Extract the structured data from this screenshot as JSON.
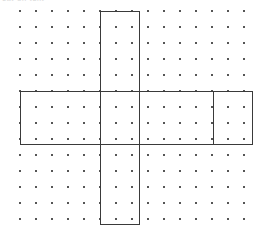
{
  "page": {
    "width": 269,
    "height": 241,
    "background_color": "#ffffff",
    "top_text_remnant": "cut-off text"
  },
  "dot_grid": {
    "name": "dot-grid",
    "dot_color": "#555555",
    "dot_size_px": 2,
    "spacing_px": 16,
    "origin_x": 20,
    "origin_y": 11,
    "columns": 15,
    "rows": 14
  },
  "figure": {
    "name": "cube-net-plus-shape",
    "line_color": "#3a3a3a",
    "line_width_px": 1,
    "vertical_bar": {
      "label": "vertical-bar",
      "left": 100,
      "right": 139,
      "top": 11,
      "bottom": 224,
      "width_units": 2,
      "height_units": 13
    },
    "horizontal_bar": {
      "label": "horizontal-bar",
      "left": 20,
      "right": 252,
      "top": 91,
      "bottom": 144,
      "width_units": 14,
      "height_units": 3
    },
    "internal_divider": {
      "label": "internal-divider",
      "x": 213,
      "top": 91,
      "bottom": 144
    }
  },
  "chart_data": {
    "type": "scatter",
    "title": "",
    "subtitle": "",
    "xlabel": "",
    "ylabel": "",
    "grid": true,
    "legend": "none",
    "xlim": [
      20,
      253
    ],
    "ylim": [
      11,
      219
    ],
    "x_ticks": [
      20,
      36,
      52,
      68,
      84,
      100,
      116,
      132,
      148,
      164,
      180,
      196,
      212,
      228,
      244
    ],
    "y_ticks": [
      11,
      27,
      43,
      59,
      75,
      91,
      107,
      123,
      139,
      155,
      171,
      187,
      203,
      219
    ],
    "annotations": [
      {
        "name": "vertical-bar-rectangle",
        "shape": "rectangle",
        "x0": 100,
        "y0": 11,
        "x1": 139,
        "y1": 224
      },
      {
        "name": "horizontal-bar-rectangle",
        "shape": "rectangle",
        "x0": 20,
        "y0": 91,
        "x1": 252,
        "y1": 144
      },
      {
        "name": "internal-divider-segment",
        "shape": "line",
        "x0": 213,
        "y0": 91,
        "x1": 213,
        "y1": 144
      }
    ]
  }
}
